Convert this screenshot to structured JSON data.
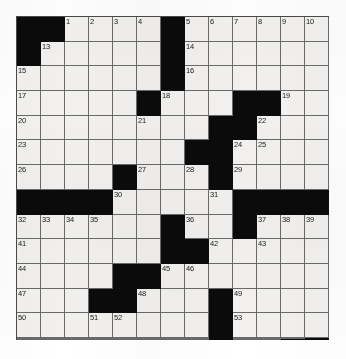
{
  "puzzle": {
    "type": "crossword-grid",
    "rows": 13,
    "columns": 13,
    "colors": {
      "block": "#0b0b0b",
      "cell": "#f2f1ef",
      "grid_line": "#6a6a6a",
      "border": "#4a4a4a",
      "number_text": "#1a1a1a",
      "page_background": "#ffffff"
    },
    "legend": {
      "block_label": "blocked-square",
      "open_label": "open-square"
    },
    "grid": [
      [
        {
          "block": true,
          "num": ""
        },
        {
          "block": true,
          "num": ""
        },
        {
          "block": false,
          "num": "1"
        },
        {
          "block": false,
          "num": "2"
        },
        {
          "block": false,
          "num": "3"
        },
        {
          "block": false,
          "num": "4"
        },
        {
          "block": true,
          "num": ""
        },
        {
          "block": false,
          "num": "5"
        },
        {
          "block": false,
          "num": "6"
        },
        {
          "block": false,
          "num": "7"
        },
        {
          "block": false,
          "num": "8"
        },
        {
          "block": false,
          "num": "9"
        },
        {
          "block": false,
          "num": "10"
        }
      ],
      [
        {
          "block": true,
          "num": ""
        },
        {
          "block": false,
          "num": "13"
        },
        {
          "block": false,
          "num": ""
        },
        {
          "block": false,
          "num": ""
        },
        {
          "block": false,
          "num": ""
        },
        {
          "block": false,
          "num": ""
        },
        {
          "block": true,
          "num": ""
        },
        {
          "block": false,
          "num": "14"
        },
        {
          "block": false,
          "num": ""
        },
        {
          "block": false,
          "num": ""
        },
        {
          "block": false,
          "num": ""
        },
        {
          "block": false,
          "num": ""
        },
        {
          "block": false,
          "num": ""
        }
      ],
      [
        {
          "block": false,
          "num": "15"
        },
        {
          "block": false,
          "num": ""
        },
        {
          "block": false,
          "num": ""
        },
        {
          "block": false,
          "num": ""
        },
        {
          "block": false,
          "num": ""
        },
        {
          "block": false,
          "num": ""
        },
        {
          "block": true,
          "num": ""
        },
        {
          "block": false,
          "num": "16"
        },
        {
          "block": false,
          "num": ""
        },
        {
          "block": false,
          "num": ""
        },
        {
          "block": false,
          "num": ""
        },
        {
          "block": false,
          "num": ""
        },
        {
          "block": false,
          "num": ""
        }
      ],
      [
        {
          "block": false,
          "num": "17"
        },
        {
          "block": false,
          "num": ""
        },
        {
          "block": false,
          "num": ""
        },
        {
          "block": false,
          "num": ""
        },
        {
          "block": false,
          "num": ""
        },
        {
          "block": true,
          "num": ""
        },
        {
          "block": false,
          "num": "18"
        },
        {
          "block": false,
          "num": ""
        },
        {
          "block": false,
          "num": ""
        },
        {
          "block": true,
          "num": ""
        },
        {
          "block": true,
          "num": ""
        },
        {
          "block": false,
          "num": "19"
        },
        {
          "block": false,
          "num": ""
        }
      ],
      [
        {
          "block": false,
          "num": "20"
        },
        {
          "block": false,
          "num": ""
        },
        {
          "block": false,
          "num": ""
        },
        {
          "block": false,
          "num": ""
        },
        {
          "block": false,
          "num": ""
        },
        {
          "block": false,
          "num": "21"
        },
        {
          "block": false,
          "num": ""
        },
        {
          "block": false,
          "num": ""
        },
        {
          "block": true,
          "num": ""
        },
        {
          "block": true,
          "num": ""
        },
        {
          "block": false,
          "num": "22"
        },
        {
          "block": false,
          "num": ""
        },
        {
          "block": false,
          "num": ""
        }
      ],
      [
        {
          "block": false,
          "num": "23"
        },
        {
          "block": false,
          "num": ""
        },
        {
          "block": false,
          "num": ""
        },
        {
          "block": false,
          "num": ""
        },
        {
          "block": false,
          "num": ""
        },
        {
          "block": false,
          "num": ""
        },
        {
          "block": false,
          "num": ""
        },
        {
          "block": true,
          "num": ""
        },
        {
          "block": true,
          "num": ""
        },
        {
          "block": false,
          "num": "24"
        },
        {
          "block": false,
          "num": "25"
        },
        {
          "block": false,
          "num": ""
        },
        {
          "block": false,
          "num": ""
        }
      ],
      [
        {
          "block": false,
          "num": "26"
        },
        {
          "block": false,
          "num": ""
        },
        {
          "block": false,
          "num": ""
        },
        {
          "block": false,
          "num": ""
        },
        {
          "block": true,
          "num": ""
        },
        {
          "block": false,
          "num": "27"
        },
        {
          "block": false,
          "num": ""
        },
        {
          "block": false,
          "num": "28"
        },
        {
          "block": true,
          "num": ""
        },
        {
          "block": false,
          "num": "29"
        },
        {
          "block": false,
          "num": ""
        },
        {
          "block": false,
          "num": ""
        },
        {
          "block": false,
          "num": ""
        }
      ],
      [
        {
          "block": true,
          "num": ""
        },
        {
          "block": true,
          "num": ""
        },
        {
          "block": true,
          "num": ""
        },
        {
          "block": true,
          "num": ""
        },
        {
          "block": false,
          "num": "30"
        },
        {
          "block": false,
          "num": ""
        },
        {
          "block": false,
          "num": ""
        },
        {
          "block": false,
          "num": ""
        },
        {
          "block": false,
          "num": "31"
        },
        {
          "block": true,
          "num": ""
        },
        {
          "block": true,
          "num": ""
        },
        {
          "block": true,
          "num": ""
        },
        {
          "block": true,
          "num": ""
        }
      ],
      [
        {
          "block": false,
          "num": "32"
        },
        {
          "block": false,
          "num": "33"
        },
        {
          "block": false,
          "num": "34"
        },
        {
          "block": false,
          "num": "35"
        },
        {
          "block": false,
          "num": ""
        },
        {
          "block": false,
          "num": ""
        },
        {
          "block": true,
          "num": ""
        },
        {
          "block": false,
          "num": "36"
        },
        {
          "block": false,
          "num": ""
        },
        {
          "block": true,
          "num": ""
        },
        {
          "block": false,
          "num": "37"
        },
        {
          "block": false,
          "num": "38"
        },
        {
          "block": false,
          "num": "39"
        }
      ],
      [
        {
          "block": false,
          "num": "41"
        },
        {
          "block": false,
          "num": ""
        },
        {
          "block": false,
          "num": ""
        },
        {
          "block": false,
          "num": ""
        },
        {
          "block": false,
          "num": ""
        },
        {
          "block": false,
          "num": ""
        },
        {
          "block": true,
          "num": ""
        },
        {
          "block": true,
          "num": ""
        },
        {
          "block": false,
          "num": "42"
        },
        {
          "block": false,
          "num": ""
        },
        {
          "block": false,
          "num": "43"
        },
        {
          "block": false,
          "num": ""
        },
        {
          "block": false,
          "num": ""
        }
      ],
      [
        {
          "block": false,
          "num": "44"
        },
        {
          "block": false,
          "num": ""
        },
        {
          "block": false,
          "num": ""
        },
        {
          "block": false,
          "num": ""
        },
        {
          "block": true,
          "num": ""
        },
        {
          "block": true,
          "num": ""
        },
        {
          "block": false,
          "num": "45"
        },
        {
          "block": false,
          "num": "46"
        },
        {
          "block": false,
          "num": ""
        },
        {
          "block": false,
          "num": ""
        },
        {
          "block": false,
          "num": ""
        },
        {
          "block": false,
          "num": ""
        },
        {
          "block": false,
          "num": ""
        }
      ],
      [
        {
          "block": false,
          "num": "47"
        },
        {
          "block": false,
          "num": ""
        },
        {
          "block": false,
          "num": ""
        },
        {
          "block": true,
          "num": ""
        },
        {
          "block": true,
          "num": ""
        },
        {
          "block": false,
          "num": "48"
        },
        {
          "block": false,
          "num": ""
        },
        {
          "block": false,
          "num": ""
        },
        {
          "block": true,
          "num": ""
        },
        {
          "block": false,
          "num": "49"
        },
        {
          "block": false,
          "num": ""
        },
        {
          "block": false,
          "num": ""
        },
        {
          "block": false,
          "num": ""
        }
      ],
      [
        {
          "block": false,
          "num": "50"
        },
        {
          "block": false,
          "num": ""
        },
        {
          "block": false,
          "num": ""
        },
        {
          "block": false,
          "num": "51"
        },
        {
          "block": false,
          "num": "52"
        },
        {
          "block": false,
          "num": ""
        },
        {
          "block": false,
          "num": ""
        },
        {
          "block": false,
          "num": ""
        },
        {
          "block": true,
          "num": ""
        },
        {
          "block": false,
          "num": "53"
        },
        {
          "block": false,
          "num": ""
        },
        {
          "block": false,
          "num": ""
        },
        {
          "block": false,
          "num": ""
        }
      ]
    ],
    "extra_rows": [
      [
        {
          "block": false,
          "num": "54"
        },
        {
          "block": false,
          "num": ""
        },
        {
          "block": false,
          "num": ""
        },
        {
          "block": false,
          "num": ""
        },
        {
          "block": false,
          "num": ""
        },
        {
          "block": false,
          "num": ""
        },
        {
          "block": false,
          "num": ""
        },
        {
          "block": false,
          "num": ""
        },
        {
          "block": true,
          "num": ""
        },
        {
          "block": false,
          "num": "55"
        },
        {
          "block": false,
          "num": ""
        },
        {
          "block": false,
          "num": ""
        },
        {
          "block": true,
          "num": ""
        }
      ],
      [
        {
          "block": false,
          "num": "56"
        },
        {
          "block": false,
          "num": ""
        },
        {
          "block": false,
          "num": ""
        },
        {
          "block": false,
          "num": ""
        },
        {
          "block": false,
          "num": ""
        },
        {
          "block": false,
          "num": ""
        },
        {
          "block": false,
          "num": ""
        },
        {
          "block": false,
          "num": ""
        },
        {
          "block": true,
          "num": ""
        },
        {
          "block": false,
          "num": "57"
        },
        {
          "block": false,
          "num": ""
        },
        {
          "block": true,
          "num": ""
        },
        {
          "block": true,
          "num": ""
        }
      ]
    ],
    "all_numbers": [
      "1",
      "2",
      "3",
      "4",
      "5",
      "6",
      "7",
      "8",
      "9",
      "10",
      "11",
      "12",
      "13",
      "14",
      "15",
      "16",
      "17",
      "18",
      "19",
      "20",
      "21",
      "22",
      "23",
      "24",
      "25",
      "26",
      "27",
      "28",
      "29",
      "30",
      "31",
      "32",
      "33",
      "34",
      "35",
      "36",
      "37",
      "38",
      "39",
      "40",
      "41",
      "42",
      "43",
      "44",
      "45",
      "46",
      "47",
      "48",
      "49",
      "50",
      "51",
      "52",
      "53",
      "54",
      "55",
      "56",
      "57"
    ]
  }
}
